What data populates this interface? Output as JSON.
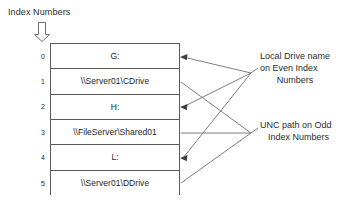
{
  "title": "Index Numbers",
  "index_arrow": "down-arrow-icon",
  "table": {
    "rows": [
      {
        "index": "0",
        "value": "G:",
        "kind": "local-drive"
      },
      {
        "index": "1",
        "value": "\\\\Server01\\CDrive",
        "kind": "unc-path"
      },
      {
        "index": "2",
        "value": "H:",
        "kind": "local-drive"
      },
      {
        "index": "3",
        "value": "\\\\FileServer\\Shared01",
        "kind": "unc-path"
      },
      {
        "index": "4",
        "value": "L:",
        "kind": "local-drive"
      },
      {
        "index": "5",
        "value": "\\\\Server01\\DDrive",
        "kind": "unc-path"
      }
    ]
  },
  "annotations": {
    "even": {
      "line1": "Local Drive name",
      "line2": "on Even Index",
      "line3": "Numbers"
    },
    "odd": {
      "line1": "UNC path on Odd",
      "line2": "Index Numbers"
    }
  },
  "colors": {
    "stroke": "#58595b",
    "text": "#2b2b2b",
    "background": "#ffffff"
  }
}
